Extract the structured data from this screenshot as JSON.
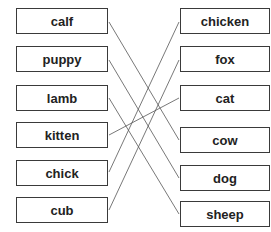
{
  "left_items": [
    {
      "label": "calf"
    },
    {
      "label": "puppy"
    },
    {
      "label": "lamb"
    },
    {
      "label": "kitten"
    },
    {
      "label": "chick"
    },
    {
      "label": "cub"
    }
  ],
  "right_items": [
    {
      "label": "chicken"
    },
    {
      "label": "fox"
    },
    {
      "label": "cat"
    },
    {
      "label": "cow"
    },
    {
      "label": "dog"
    },
    {
      "label": "sheep"
    }
  ],
  "connections": [
    {
      "from": "calf",
      "to": "cow"
    },
    {
      "from": "puppy",
      "to": "dog"
    },
    {
      "from": "lamb",
      "to": "sheep"
    },
    {
      "from": "kitten",
      "to": "cat"
    },
    {
      "from": "chick",
      "to": "chicken"
    },
    {
      "from": "cub",
      "to": "fox"
    }
  ]
}
